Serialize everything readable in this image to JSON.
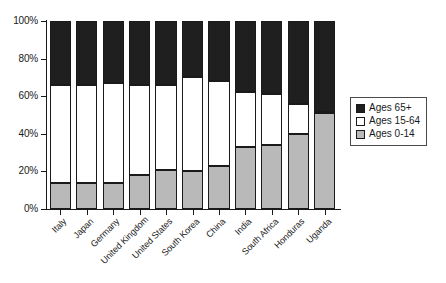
{
  "chart_data": {
    "type": "bar",
    "subtype": "stacked-percentage",
    "title": "",
    "subtitle": "",
    "xlabel": "",
    "ylabel": "",
    "ylim": [
      0,
      100
    ],
    "yticks": [
      "0%",
      "20%",
      "40%",
      "60%",
      "80%",
      "100%"
    ],
    "ytick_values": [
      0,
      20,
      40,
      60,
      80,
      100
    ],
    "grid": false,
    "legend_position": "right",
    "categories": [
      "Italy",
      "Japan",
      "Germany",
      "United Kingdom",
      "United States",
      "South Korea",
      "China",
      "India",
      "South Africa",
      "Honduras",
      "Uganda"
    ],
    "series": [
      {
        "name": "Ages 0-14",
        "color": "#b9b9b9",
        "values": [
          14,
          14,
          14,
          18,
          21,
          20,
          23,
          33,
          34,
          40,
          51
        ]
      },
      {
        "name": "Ages 15-64",
        "color": "#ffffff",
        "values": [
          66,
          66,
          67,
          66,
          66,
          70,
          68,
          62,
          61,
          56,
          47
        ]
      },
      {
        "name": "Ages 65+",
        "color": "#1f1f1f",
        "values": [
          20,
          20,
          19,
          16,
          13,
          10,
          9,
          5,
          5,
          4,
          2
        ]
      }
    ],
    "stack_tops": {
      "young": [
        14,
        14,
        14,
        18,
        21,
        20,
        23,
        33,
        34,
        40,
        51
      ],
      "middle": [
        80,
        80,
        81,
        84,
        87,
        90,
        91,
        95,
        95,
        96,
        98
      ]
    }
  },
  "legend": {
    "items": [
      {
        "label": "Ages 65+",
        "swatch": "old"
      },
      {
        "label": "Ages 15-64",
        "swatch": "middle"
      },
      {
        "label": "Ages 0-14",
        "swatch": "young"
      }
    ]
  }
}
